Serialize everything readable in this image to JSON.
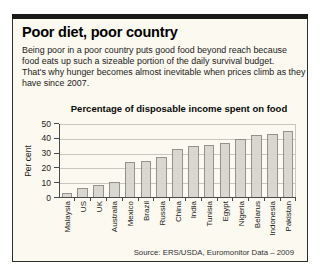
{
  "header": {
    "title": "Poor diet, poor country",
    "body_lines": [
      "Being poor in a poor country puts good food beyond reach because",
      "food eats up such a sizeable portion of the daily survival budget.",
      "That's why hunger becomes almost inevitable when prices climb as they",
      "have since 2007."
    ]
  },
  "chart_data": {
    "type": "bar",
    "title": "Percentage of disposable income spent on food",
    "ylabel": "Per cent",
    "categories": [
      "Malaysia",
      "US",
      "UK",
      "Australia",
      "Mexico",
      "Brazil",
      "Russia",
      "China",
      "India",
      "Tunisia",
      "Egypt",
      "Nigeria",
      "Belarus",
      "Indonesia",
      "Pakistan"
    ],
    "values": [
      3.5,
      7,
      9,
      11,
      24,
      25,
      28,
      33,
      35,
      36,
      37.5,
      40,
      42.5,
      43,
      45.5
    ],
    "ylim": [
      0,
      50
    ],
    "yticks": [
      0,
      10,
      20,
      30,
      40,
      50
    ],
    "grid": true,
    "legend": "none",
    "source": "Source: ERS/USDA, Euromonitor Data – 2009"
  },
  "colors": {
    "card_background": "#fbf9f0",
    "top_bar": "#1a1a1a",
    "bar_fill": "#d6d5ce",
    "bar_border": "#8b8a84",
    "gridline": "#c8c7bf",
    "axis": "#4a4a4a"
  }
}
